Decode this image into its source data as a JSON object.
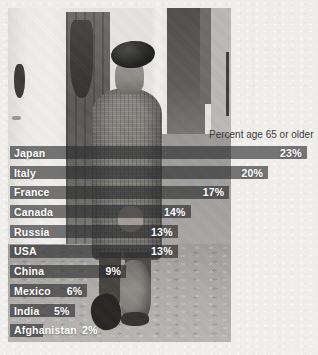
{
  "page": {
    "background": "#eeedea"
  },
  "photo": {
    "alt": "Black-and-white photo of an elderly man in a beret and tweed coat, seen from behind, walking down a cobblestone alley"
  },
  "chart_data": {
    "type": "bar",
    "orientation": "horizontal",
    "title": "Percent age 65 or older",
    "categories": [
      "Japan",
      "Italy",
      "France",
      "Canada",
      "Russia",
      "USA",
      "China",
      "Mexico",
      "India",
      "Afghanistan"
    ],
    "values": [
      23,
      20,
      17,
      14,
      13,
      13,
      9,
      6,
      5,
      2
    ],
    "value_labels": [
      "23%",
      "20%",
      "17%",
      "14%",
      "13%",
      "13%",
      "9%",
      "6%",
      "5%",
      "2%"
    ],
    "unit": "%",
    "xlim": [
      0,
      24
    ],
    "grid": false,
    "legend": "none",
    "bar_color": "rgba(40,40,44,0.62)",
    "label_color": "#ffffff",
    "title_color": "#3a3a3a"
  }
}
